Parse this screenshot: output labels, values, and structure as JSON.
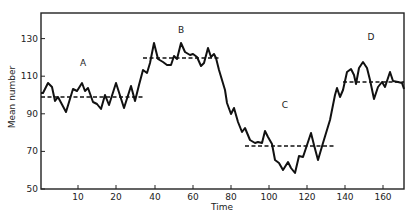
{
  "chart_data": {
    "type": "line",
    "title": "",
    "xlabel": "Time",
    "ylabel": "Mean number",
    "xlim": [
      -20,
      171
    ],
    "ylim": [
      50,
      142
    ],
    "grid": false,
    "legend": null,
    "x_ticks": [
      {
        "label": "10",
        "px": 78
      },
      {
        "label": "20",
        "px": 116
      },
      {
        "label": "40",
        "px": 155
      },
      {
        "label": "60",
        "px": 193
      },
      {
        "label": "80",
        "px": 231
      },
      {
        "label": "100",
        "px": 269
      },
      {
        "label": "120",
        "px": 307
      },
      {
        "label": "140",
        "px": 345
      },
      {
        "label": "160",
        "px": 383
      }
    ],
    "y_ticks": [
      {
        "label": "50",
        "value": 50
      },
      {
        "label": "70",
        "value": 70
      },
      {
        "label": "90",
        "value": 90
      },
      {
        "label": "110",
        "value": 110
      },
      {
        "label": "130",
        "value": 130
      }
    ],
    "series": [
      {
        "name": "Mean number",
        "style": "solid",
        "points_px": [
          [
            41,
            93
          ],
          [
            43,
            93
          ],
          [
            48,
            83
          ],
          [
            52,
            87
          ],
          [
            55,
            101
          ],
          [
            58,
            97
          ],
          [
            66,
            112
          ],
          [
            73,
            89
          ],
          [
            77,
            91
          ],
          [
            82,
            83
          ],
          [
            85,
            91
          ],
          [
            88,
            88
          ],
          [
            93,
            102
          ],
          [
            97,
            104
          ],
          [
            101,
            109
          ],
          [
            105,
            95
          ],
          [
            109,
            105
          ],
          [
            116,
            83
          ],
          [
            124,
            108
          ],
          [
            131,
            86
          ],
          [
            135,
            101
          ],
          [
            139,
            85
          ],
          [
            143,
            70
          ],
          [
            147,
            73
          ],
          [
            150,
            63
          ],
          [
            154,
            43
          ],
          [
            158,
            59
          ],
          [
            163,
            62
          ],
          [
            167,
            65
          ],
          [
            171,
            65
          ],
          [
            174,
            56
          ],
          [
            177,
            59
          ],
          [
            181,
            43
          ],
          [
            185,
            52
          ],
          [
            190,
            55
          ],
          [
            193,
            54
          ],
          [
            197,
            57
          ],
          [
            201,
            66
          ],
          [
            204,
            63
          ],
          [
            208,
            48
          ],
          [
            211,
            57
          ],
          [
            214,
            54
          ],
          [
            216,
            58
          ],
          [
            219,
            70
          ],
          [
            225,
            90
          ],
          [
            227,
            103
          ],
          [
            231,
            114
          ],
          [
            234,
            108
          ],
          [
            238,
            122
          ],
          [
            242,
            132
          ],
          [
            245,
            128
          ],
          [
            250,
            140
          ],
          [
            255,
            143
          ],
          [
            258,
            142
          ],
          [
            262,
            143
          ],
          [
            265,
            131
          ],
          [
            268,
            137
          ],
          [
            272,
            144
          ],
          [
            275,
            160
          ],
          [
            279,
            163
          ],
          [
            283,
            170
          ],
          [
            288,
            162
          ],
          [
            291,
            168
          ],
          [
            295,
            173
          ],
          [
            299,
            156
          ],
          [
            303,
            157
          ],
          [
            307,
            145
          ],
          [
            311,
            133
          ],
          [
            314,
            145
          ],
          [
            318,
            160
          ],
          [
            323,
            143
          ],
          [
            330,
            120
          ],
          [
            335,
            95
          ],
          [
            337,
            88
          ],
          [
            340,
            97
          ],
          [
            343,
            90
          ],
          [
            347,
            72
          ],
          [
            351,
            69
          ],
          [
            354,
            75
          ],
          [
            356,
            84
          ],
          [
            359,
            68
          ],
          [
            363,
            62
          ],
          [
            367,
            68
          ],
          [
            370,
            80
          ],
          [
            374,
            99
          ],
          [
            378,
            87
          ],
          [
            382,
            82
          ],
          [
            385,
            87
          ],
          [
            390,
            72
          ],
          [
            393,
            81
          ],
          [
            398,
            82
          ],
          [
            402,
            83
          ],
          [
            404,
            89
          ]
        ]
      }
    ],
    "segments": [
      {
        "label": "A",
        "mean": 99,
        "x_start_px": 41,
        "x_end_px": 143,
        "y_px": 97,
        "label_x": 83,
        "label_y": 66
      },
      {
        "label": "B",
        "mean": 120,
        "x_start_px": 143,
        "x_end_px": 220,
        "y_px": 58,
        "label_x": 181,
        "label_y": 33
      },
      {
        "label": "C",
        "mean": 73,
        "x_start_px": 245,
        "x_end_px": 335,
        "y_px": 146,
        "label_x": 285,
        "label_y": 108
      },
      {
        "label": "D",
        "mean": 108,
        "x_start_px": 343,
        "x_end_px": 404,
        "y_px": 82,
        "label_x": 371,
        "label_y": 40
      }
    ]
  },
  "layout": {
    "frame": {
      "left": 41,
      "top": 13,
      "right": 404,
      "bottom": 189
    },
    "y_px_per_unit": 1.88,
    "y_zero_value": 50
  },
  "colors": {
    "line": "#111111",
    "axis": "#222222",
    "background": "#ffffff"
  }
}
